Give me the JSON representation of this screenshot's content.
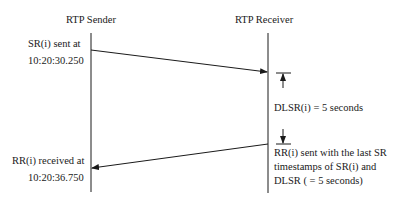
{
  "diagram": {
    "type": "sequence",
    "participants": [
      {
        "id": "sender",
        "label": "RTP Sender"
      },
      {
        "id": "receiver",
        "label": "RTP Receiver"
      }
    ],
    "messages": [
      {
        "from": "sender",
        "to": "receiver",
        "label": "SR(i)"
      },
      {
        "from": "receiver",
        "to": "sender",
        "label": "RR(i)"
      }
    ],
    "annotations": {
      "sr_sent_line1": "SR(i) sent at",
      "sr_sent_line2": "10:20:30.250",
      "rr_received_line1": "RR(i) received at",
      "rr_received_line2": "10:20:36.750",
      "dlsr": "DLSR(i) = 5 seconds",
      "rr_sent_line1": "RR(i) sent with the last SR",
      "rr_sent_line2": "timestamps of SR(i) and",
      "rr_sent_line3": "DLSR ( = 5 seconds)"
    }
  }
}
